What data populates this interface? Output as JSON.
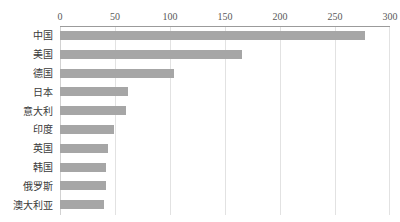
{
  "chart_data": {
    "type": "bar",
    "orientation": "horizontal",
    "title": "",
    "subtitle": "",
    "xlabel": "",
    "ylabel": "",
    "categories": [
      "中国",
      "美国",
      "德国",
      "日本",
      "意大利",
      "印度",
      "英国",
      "韩国",
      "俄罗斯",
      "澳大利亚"
    ],
    "values": [
      277,
      165,
      104,
      62,
      60,
      49,
      44,
      42,
      42,
      40
    ],
    "series": [
      {
        "name": "",
        "values": [
          277,
          165,
          104,
          62,
          60,
          49,
          44,
          42,
          42,
          40
        ]
      }
    ],
    "xlim": [
      0,
      300
    ],
    "xticks": [
      0,
      50,
      100,
      150,
      200,
      250,
      300
    ],
    "xtick_labels": [
      "0",
      "50",
      "100",
      "150",
      "200",
      "250",
      "300"
    ],
    "grid": "vertical",
    "legend": "none",
    "bar_color": "#a6a6a6",
    "gridline_color": "#e2e2e2",
    "axis_line_color": "#9b9b9b",
    "text_color": "#3a3a3a",
    "background": "#ffffff"
  }
}
